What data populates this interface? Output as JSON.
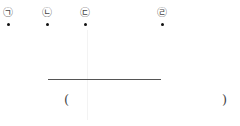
{
  "markers": [
    {
      "label": "㉠"
    },
    {
      "label": "㉡"
    },
    {
      "label": "㉢"
    },
    {
      "label": "㉣"
    }
  ],
  "answer": {
    "open_paren": "(",
    "close_paren": ")"
  }
}
